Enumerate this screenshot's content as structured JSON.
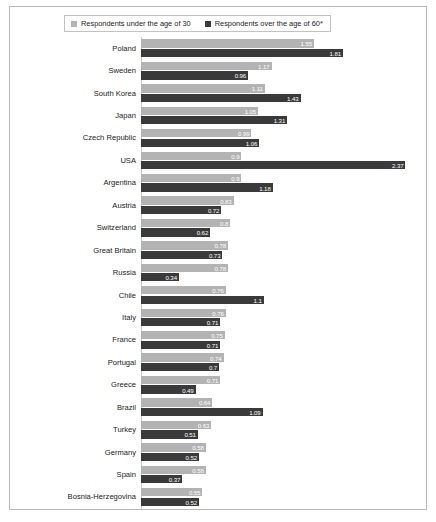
{
  "legend": {
    "series": [
      {
        "label": "Respondents under the age of 30",
        "color": "#b3b3b3",
        "key": "under30"
      },
      {
        "label": "Respondents over the age of 60*",
        "color": "#3a3a3a",
        "key": "over60"
      }
    ]
  },
  "chart_data": {
    "type": "bar",
    "orientation": "horizontal",
    "title": "",
    "subtitle": "",
    "xlabel": "",
    "ylabel": "",
    "grid": false,
    "legend_position": "top",
    "xlim": [
      0,
      2.5
    ],
    "categories": [
      "Poland",
      "Sweden",
      "South Korea",
      "Japan",
      "Czech Republic",
      "USA",
      "Argentina",
      "Austria",
      "Switzerland",
      "Great Britain",
      "Russia",
      "Chile",
      "Italy",
      "France",
      "Portugal",
      "Greece",
      "Brazil",
      "Turkey",
      "Germany",
      "Spain",
      "Bosnia-Herzegovina"
    ],
    "series": [
      {
        "name": "Respondents under the age of 30",
        "color": "#b3b3b3",
        "values": [
          1.55,
          1.17,
          1.11,
          1.05,
          0.99,
          0.9,
          0.9,
          0.83,
          0.8,
          0.78,
          0.78,
          0.76,
          0.76,
          0.75,
          0.74,
          0.71,
          0.64,
          0.63,
          0.58,
          0.58,
          0.55
        ],
        "labels": [
          "1.55",
          "1.17",
          "1.11",
          "1.05",
          "0.99",
          "0.9",
          "0.9",
          "0.83",
          "0.8",
          "0.78",
          "0.78",
          "0.76",
          "0.76",
          "0.75",
          "0.74",
          "0.71",
          "0.64",
          "0.63",
          "0.58",
          "0.58",
          "0.55"
        ]
      },
      {
        "name": "Respondents over the age of 60*",
        "color": "#3a3a3a",
        "values": [
          1.81,
          0.96,
          1.43,
          1.31,
          1.06,
          2.37,
          1.18,
          0.72,
          0.62,
          0.73,
          0.34,
          1.1,
          0.71,
          0.71,
          0.7,
          0.49,
          1.09,
          0.51,
          0.52,
          0.37,
          0.52
        ],
        "labels": [
          "1.81",
          "0.96",
          "1.43",
          "1.31",
          "1.06",
          "2.37",
          "1.18",
          "0.72",
          "0.62",
          "0.73",
          "0.34",
          "1.1",
          "0.71",
          "0.71",
          "0.7",
          "0.49",
          "1.09",
          "0.51",
          "0.52",
          "0.37",
          "0.52"
        ]
      }
    ]
  }
}
